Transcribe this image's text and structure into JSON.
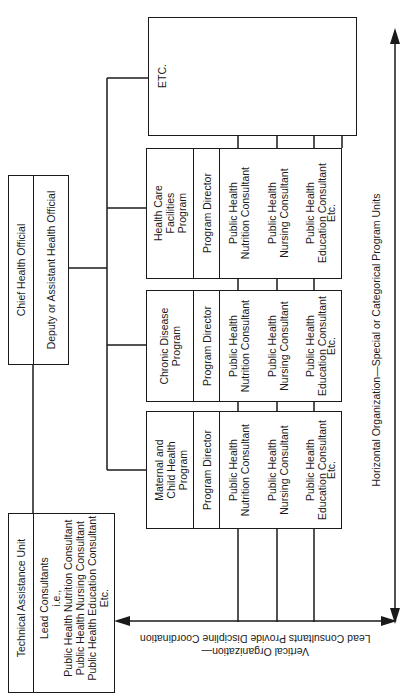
{
  "chief": {
    "title": "Chief Health Official",
    "deputy": "Deputy or Assistant Health Official"
  },
  "technical_assistance": {
    "title": "Technical Assistance Unit",
    "body": "Lead Consultants\ni.e.,\nPublic Health Nutrition Consultant\nPublic Health Nursing Consultant\nPublic Health Education Consultant\nEtc."
  },
  "programs": [
    {
      "name": "Maternal and\nChild Health\nProgram",
      "director": "Program Director",
      "consultants": [
        "Public Health\nNutrition Consultant",
        "Public Health\nNursing Consultant",
        "Public Health\nEducation Consultant"
      ],
      "etc": "Etc."
    },
    {
      "name": "Chronic Disease\nProgram",
      "director": "Program Director",
      "consultants": [
        "Public Health\nNutrition Consultant",
        "Public Health\nNursing Consultant",
        "Public Health\nEducation Consultant"
      ],
      "etc": "Etc."
    },
    {
      "name": "Health Care\nFacilities\nProgram",
      "director": "Program Director",
      "consultants": [
        "Public Health\nNutrition Consultant",
        "Public Health\nNursing Consultant",
        "Public Health\nEducation Consultant"
      ],
      "etc": "Etc."
    },
    {
      "name": "ETC."
    }
  ],
  "axes": {
    "horizontal_label": "Horizontal Organization—Special or Categorical Program Units",
    "vertical_label": "Vertical Organization—\nLead Consultants Provide Discipline Coordination"
  }
}
